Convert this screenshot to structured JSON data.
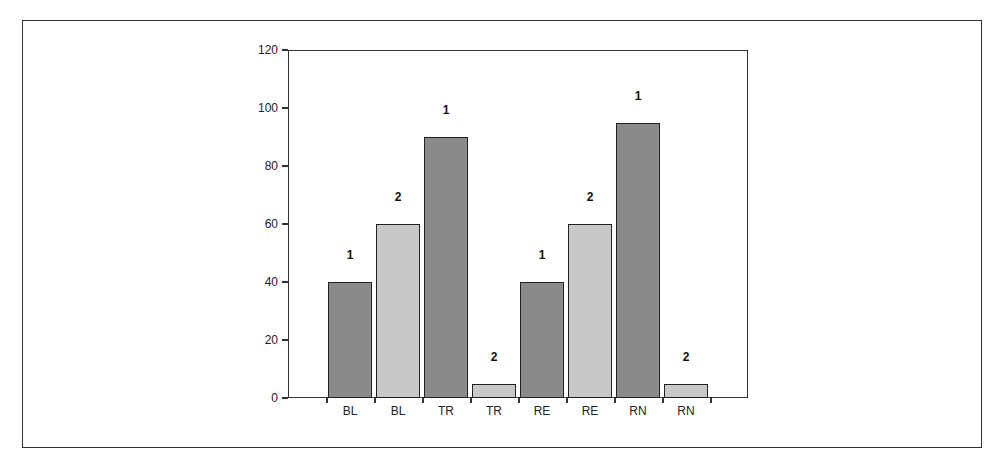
{
  "chart_data": {
    "type": "bar",
    "title": "",
    "xlabel": "",
    "ylabel": "",
    "ylim": [
      0,
      120
    ],
    "yticks": [
      0,
      20,
      40,
      60,
      80,
      100,
      120
    ],
    "grid": false,
    "legend": null,
    "categories": [
      "BL",
      "BL",
      "TR",
      "TR",
      "RE",
      "RE",
      "RN",
      "RN"
    ],
    "bar_labels": [
      "1",
      "2",
      "1",
      "2",
      "1",
      "2",
      "1",
      "2"
    ],
    "values": [
      40,
      60,
      90,
      5,
      40,
      60,
      95,
      5
    ],
    "series_colors": {
      "1": "#8a8a8a",
      "2": "#c8c8c8"
    }
  }
}
